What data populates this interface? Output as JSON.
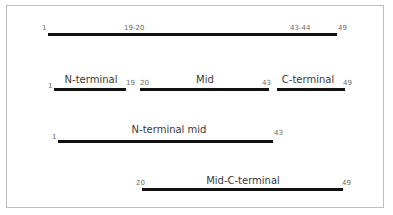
{
  "diagram": {
    "full": {
      "start": "1",
      "cut1": "19-20",
      "cut2": "43-44",
      "end": "49"
    },
    "fragments": [
      {
        "name": "N-terminal",
        "start": "1",
        "end": "19"
      },
      {
        "name": "Mid",
        "start": "20",
        "end": "43"
      },
      {
        "name": "C-terminal",
        "start": "",
        "end": "49"
      }
    ],
    "n_terminal_mid": {
      "name": "N-terminal mid",
      "start": "1",
      "end": "43"
    },
    "mid_c_terminal": {
      "name": "Mid-C-terminal",
      "start": "20",
      "end": "49"
    },
    "colors": {
      "bar": "#111111",
      "border": "#bdbdbd",
      "text": "#3a3a3a",
      "numbers": "#6b6b6b"
    }
  }
}
